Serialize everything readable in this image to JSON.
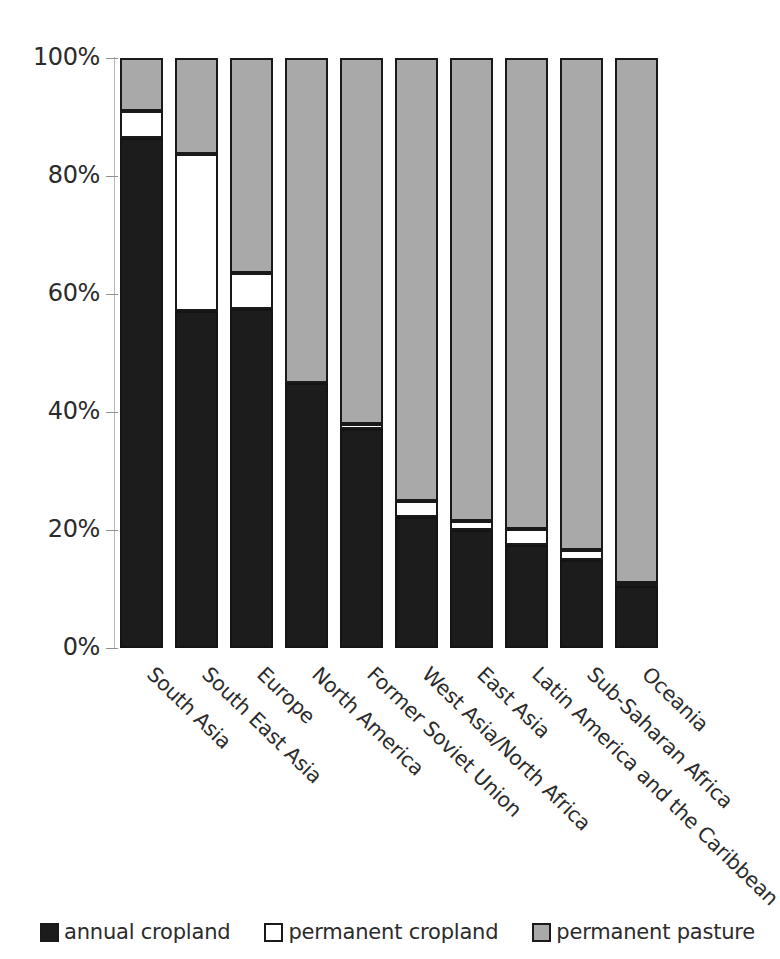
{
  "chart_data": {
    "type": "bar",
    "subtype": "stacked-bar-100-percent",
    "title": "",
    "xlabel": "",
    "ylabel": "",
    "ylim": [
      0,
      100
    ],
    "ytick_labels": [
      "100%",
      "80%",
      "60%",
      "40%",
      "20%",
      "0%"
    ],
    "ytick_values": [
      100,
      80,
      60,
      40,
      20,
      0
    ],
    "grid": false,
    "legend_position": "bottom",
    "categories": [
      "South Asia",
      "South East Asia",
      "Europe",
      "North America",
      "Former Soviet Union",
      "West Asia/North Africa",
      "East Asia",
      "Latin America and the Caribbean",
      "Sub-Saharan Africa",
      "Oceania"
    ],
    "series": [
      {
        "name": "annual cropland",
        "color": "#1c1c1c",
        "values": [
          86.5,
          57.2,
          57.5,
          44.9,
          37.1,
          22.2,
          20.0,
          17.5,
          14.9,
          10.5
        ]
      },
      {
        "name": "permanent cropland",
        "color": "#ffffff",
        "values": [
          4.5,
          26.6,
          6.0,
          0.0,
          0.9,
          2.8,
          1.6,
          2.7,
          1.7,
          0.5
        ]
      },
      {
        "name": "permanent pasture",
        "color": "#a9a9a9",
        "values": [
          9.0,
          16.2,
          36.5,
          55.1,
          62.0,
          75.0,
          78.4,
          79.8,
          83.4,
          89.0
        ]
      }
    ]
  },
  "legend": {
    "items": [
      {
        "label": "annual cropland",
        "swatch": "annual"
      },
      {
        "label": "permanent cropland",
        "swatch": "permanent"
      },
      {
        "label": "permanent pasture",
        "swatch": "pasture"
      }
    ]
  }
}
